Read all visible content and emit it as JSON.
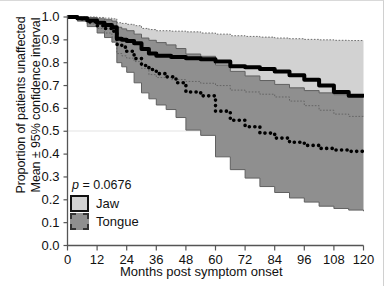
{
  "chart_data": {
    "type": "line",
    "title": "",
    "xlabel": "Months post symptom onset",
    "ylabel_line1": "Proportion of patients unaffected",
    "ylabel_line2": "Mean ± 95% confidence interval",
    "xlim": [
      0,
      120
    ],
    "ylim": [
      0.0,
      1.0
    ],
    "xticks": [
      0,
      12,
      24,
      36,
      48,
      60,
      72,
      84,
      96,
      108,
      120
    ],
    "xtick_labels": [
      "0",
      "12",
      "24",
      "36",
      "48",
      "60",
      "72",
      "84",
      "96",
      "108",
      "120"
    ],
    "yticks": [
      0.0,
      0.1,
      0.2,
      0.3,
      0.4,
      0.5,
      0.6,
      0.7,
      0.8,
      0.9,
      1.0
    ],
    "ytick_labels": [
      "0.0",
      "0.1",
      "0.2",
      "0.3",
      "0.4",
      "0.5",
      "0.6",
      "0.7",
      "0.8",
      "0.9",
      "1.0"
    ],
    "grid": "single horizontal gridline at y=0.5",
    "gridline_y": 0.5,
    "legend_position": "lower-left inside axes",
    "annotation_p_value": "p = 0.0676",
    "colors": {
      "jaw_band": "#d2d2d2",
      "tongue_band": "#8f8f8f",
      "jaw_line": "#000000",
      "tongue_line": "#000000",
      "ci_line": "#606060",
      "axis": "#4d4d4d",
      "gridline": "#e2e2e2"
    },
    "series": [
      {
        "name": "Jaw",
        "style": "solid-thick",
        "x": [
          0,
          4,
          8,
          12,
          15,
          18,
          20,
          22,
          24,
          27,
          30,
          33,
          36,
          42,
          48,
          54,
          60,
          66,
          72,
          78,
          84,
          90,
          96,
          102,
          108,
          114,
          120
        ],
        "values": [
          1.0,
          0.995,
          0.985,
          0.975,
          0.965,
          0.955,
          0.905,
          0.9,
          0.895,
          0.885,
          0.86,
          0.84,
          0.83,
          0.825,
          0.82,
          0.815,
          0.805,
          0.785,
          0.78,
          0.772,
          0.762,
          0.745,
          0.725,
          0.7,
          0.672,
          0.655,
          0.648
        ],
        "ci_upper": [
          1.0,
          1.0,
          1.0,
          0.998,
          0.995,
          0.992,
          0.975,
          0.972,
          0.968,
          0.962,
          0.95,
          0.945,
          0.94,
          0.938,
          0.935,
          0.93,
          0.925,
          0.918,
          0.915,
          0.912,
          0.908,
          0.905,
          0.902,
          0.9,
          0.898,
          0.897,
          0.896
        ],
        "ci_lower": [
          1.0,
          0.985,
          0.97,
          0.95,
          0.93,
          0.912,
          0.84,
          0.83,
          0.82,
          0.805,
          0.775,
          0.748,
          0.735,
          0.726,
          0.718,
          0.71,
          0.7,
          0.68,
          0.672,
          0.662,
          0.65,
          0.632,
          0.612,
          0.592,
          0.575,
          0.565,
          0.56
        ]
      },
      {
        "name": "Tongue",
        "style": "dotted-thick",
        "x": [
          0,
          4,
          8,
          12,
          15,
          18,
          20,
          22,
          24,
          27,
          30,
          33,
          36,
          40,
          44,
          48,
          54,
          60,
          66,
          72,
          78,
          84,
          90,
          96,
          102,
          108,
          114,
          120
        ],
        "values": [
          1.0,
          0.992,
          0.978,
          0.962,
          0.95,
          0.938,
          0.88,
          0.868,
          0.85,
          0.818,
          0.788,
          0.77,
          0.752,
          0.738,
          0.712,
          0.672,
          0.655,
          0.588,
          0.548,
          0.52,
          0.492,
          0.47,
          0.452,
          0.438,
          0.425,
          0.418,
          0.412,
          0.408
        ],
        "ci_upper": [
          1.0,
          1.0,
          0.998,
          0.992,
          0.988,
          0.982,
          0.955,
          0.948,
          0.94,
          0.925,
          0.908,
          0.898,
          0.888,
          0.878,
          0.862,
          0.838,
          0.828,
          0.79,
          0.762,
          0.742,
          0.722,
          0.705,
          0.69,
          0.678,
          0.668,
          0.66,
          0.655,
          0.652
        ],
        "ci_lower": [
          1.0,
          0.982,
          0.958,
          0.93,
          0.91,
          0.89,
          0.8,
          0.782,
          0.758,
          0.712,
          0.668,
          0.642,
          0.615,
          0.595,
          0.56,
          0.505,
          0.482,
          0.388,
          0.332,
          0.295,
          0.258,
          0.232,
          0.208,
          0.19,
          0.172,
          0.162,
          0.155,
          0.15
        ]
      }
    ]
  },
  "axes": {
    "ylabel_line1": "Proportion of patients unaffected",
    "ylabel_line2": "Mean ± 95% confidence interval",
    "xlabel": "Months post symptom onset"
  },
  "legend": {
    "p_value_prefix": "p",
    "p_value_rest": " = 0.0676",
    "items": [
      {
        "label": "Jaw",
        "swatch": "light-gray-solid-border"
      },
      {
        "label": "Tongue",
        "swatch": "dark-gray-dashed-border"
      }
    ]
  }
}
